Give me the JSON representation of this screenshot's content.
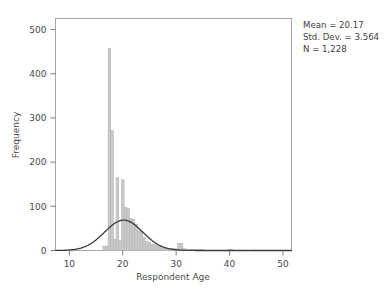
{
  "figure": {
    "background_color": "#ffffff",
    "frame_color": "#a6a6a6"
  },
  "annotations": {
    "mean_label": "Mean = 20.17",
    "stddev_label": "Std. Dev. = 3.564",
    "n_label": "N = 1,228"
  },
  "chart_data": {
    "type": "bar",
    "title": "",
    "subtitle": "",
    "xlabel": "Respondent Age",
    "ylabel": "Frequency",
    "xlim": [
      7.4,
      51.6
    ],
    "ylim": [
      0,
      525
    ],
    "xticks": [
      10,
      20,
      30,
      40,
      50
    ],
    "xtick_labels": [
      "10",
      "20",
      "30",
      "40",
      "50"
    ],
    "yticks": [
      0,
      100,
      200,
      300,
      400,
      500
    ],
    "ytick_labels": [
      "0",
      "100",
      "200",
      "300",
      "400",
      "500"
    ],
    "grid": false,
    "legend": false,
    "bar_color": "#c9c9c9",
    "bar_edge_color": "#b0b0b0",
    "bin_width": 0.5,
    "categories": [
      16.5,
      17.0,
      17.5,
      18.0,
      18.5,
      19.0,
      19.5,
      20.0,
      20.5,
      21.0,
      21.5,
      22.0,
      22.5,
      23.0,
      23.5,
      24.0,
      24.5,
      25.0,
      25.5,
      26.0,
      26.5,
      27.0,
      27.5,
      28.0,
      28.5,
      29.0,
      29.5,
      30.0,
      30.5,
      31.0,
      31.5,
      32.0,
      32.5,
      33.0,
      33.5,
      34.0,
      34.5,
      35.0,
      39.5,
      40.0,
      40.5,
      44.5,
      49.5
    ],
    "values": [
      10,
      10,
      457,
      272,
      25,
      165,
      22,
      160,
      98,
      95,
      72,
      70,
      60,
      45,
      44,
      30,
      20,
      18,
      14,
      13,
      11,
      9,
      7,
      6,
      5,
      5,
      4,
      4,
      16,
      16,
      4,
      3,
      3,
      2,
      2,
      2,
      2,
      2,
      1,
      3,
      2,
      1,
      1
    ],
    "overlay_curve": {
      "name": "normal-distribution-curve",
      "type": "line",
      "color": "#3c3c3c",
      "mean": 20.17,
      "std_dev": 3.564,
      "n": 1228,
      "bin_width": 0.5,
      "peak_value": 137
    }
  }
}
